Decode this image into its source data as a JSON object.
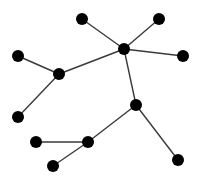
{
  "diagram": {
    "type": "tree-graph",
    "canvas": {
      "width": 199,
      "height": 179,
      "background": "#ffffff"
    },
    "style": {
      "node_color": "#000000",
      "edge_color": "#3a3a3a",
      "node_radius": 6,
      "edge_width": 1.4
    },
    "nodes": [
      {
        "id": "n1",
        "x": 82,
        "y": 19
      },
      {
        "id": "n2",
        "x": 159,
        "y": 19
      },
      {
        "id": "n3",
        "x": 124,
        "y": 49
      },
      {
        "id": "n4",
        "x": 183,
        "y": 56
      },
      {
        "id": "n5",
        "x": 18,
        "y": 56
      },
      {
        "id": "n6",
        "x": 59,
        "y": 74
      },
      {
        "id": "n7",
        "x": 18,
        "y": 117
      },
      {
        "id": "n8",
        "x": 136,
        "y": 105
      },
      {
        "id": "n9",
        "x": 36,
        "y": 142
      },
      {
        "id": "n10",
        "x": 88,
        "y": 142
      },
      {
        "id": "n11",
        "x": 53,
        "y": 166
      },
      {
        "id": "n12",
        "x": 178,
        "y": 160
      }
    ],
    "edges": [
      {
        "from": "n1",
        "to": "n3"
      },
      {
        "from": "n2",
        "to": "n3"
      },
      {
        "from": "n4",
        "to": "n3"
      },
      {
        "from": "n6",
        "to": "n3"
      },
      {
        "from": "n5",
        "to": "n6"
      },
      {
        "from": "n7",
        "to": "n6"
      },
      {
        "from": "n3",
        "to": "n8"
      },
      {
        "from": "n8",
        "to": "n12"
      },
      {
        "from": "n8",
        "to": "n10"
      },
      {
        "from": "n9",
        "to": "n10"
      },
      {
        "from": "n11",
        "to": "n10"
      }
    ]
  }
}
